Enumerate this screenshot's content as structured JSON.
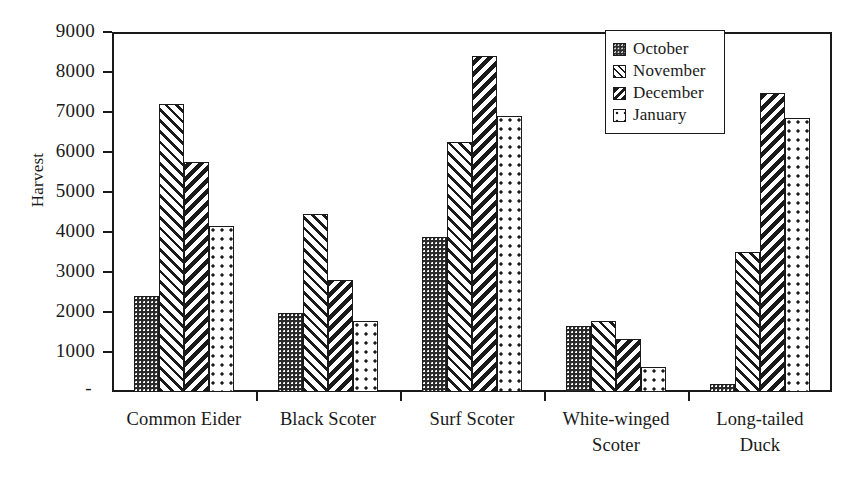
{
  "chart_data": {
    "type": "bar",
    "title": "",
    "subtitle": "",
    "xlabel": "",
    "ylabel": "Harvest",
    "ylim": [
      0,
      9000
    ],
    "ytick_interval": 1000,
    "yticks": [
      "9000",
      "8000",
      "7000",
      "6000",
      "5000",
      "4000",
      "3000",
      "2000",
      "1000",
      "-"
    ],
    "ytick_values": [
      9000,
      8000,
      7000,
      6000,
      5000,
      4000,
      3000,
      2000,
      1000,
      0
    ],
    "grid": false,
    "legend_position": "top-right",
    "categories": [
      "Common Eider",
      "Black Scoter",
      "Surf Scoter",
      "White-winged Scoter",
      "Long-tailed Duck"
    ],
    "category_label_lines": [
      [
        "Common Eider"
      ],
      [
        "Black Scoter"
      ],
      [
        "Surf Scoter"
      ],
      [
        "White-winged",
        "Scoter"
      ],
      [
        "Long-tailed",
        "Duck"
      ]
    ],
    "series": [
      {
        "name": "October",
        "pattern": "dark-dotted",
        "values": [
          2400,
          1980,
          3870,
          1650,
          200
        ]
      },
      {
        "name": "November",
        "pattern": "light-diagonal-hatch",
        "values": [
          7200,
          4460,
          6250,
          1780,
          3490
        ]
      },
      {
        "name": "December",
        "pattern": "dark-diagonal-hatch",
        "values": [
          5750,
          2790,
          8400,
          1320,
          7480
        ]
      },
      {
        "name": "January",
        "pattern": "sparse-dots",
        "values": [
          4150,
          1780,
          6900,
          620,
          6850
        ]
      }
    ]
  },
  "legend": {
    "items": [
      {
        "label": "October",
        "swatch": "october-swatch-icon"
      },
      {
        "label": "November",
        "swatch": "november-swatch-icon"
      },
      {
        "label": "December",
        "swatch": "december-swatch-icon"
      },
      {
        "label": "January",
        "swatch": "january-swatch-icon"
      }
    ]
  },
  "colors": {
    "ink": "#1a1a1a",
    "fill_dark": "#2b2b2b",
    "background": "#ffffff"
  }
}
